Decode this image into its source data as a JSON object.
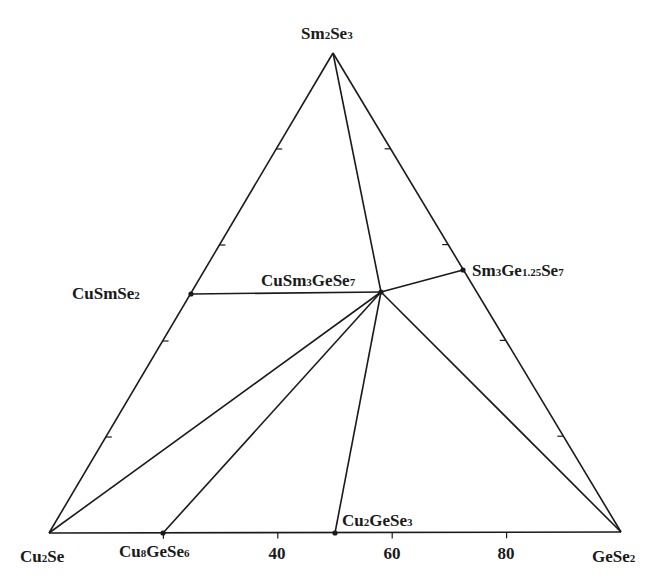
{
  "diagram": {
    "type": "ternary-phase-diagram",
    "line_color": "#1a1a1a",
    "vertices": {
      "top": {
        "label_parts": [
          [
            "Sm",
            ""
          ],
          [
            "2",
            "sub"
          ],
          [
            "Se",
            ""
          ],
          [
            "3",
            "sub"
          ]
        ],
        "x": 333,
        "y": 53
      },
      "bottom_left": {
        "label_parts": [
          [
            "Cu",
            ""
          ],
          [
            "2",
            "sub"
          ],
          [
            "Se",
            ""
          ]
        ],
        "x": 49,
        "y": 533
      },
      "bottom_right": {
        "label_parts": [
          [
            "GeSe",
            ""
          ],
          [
            "2",
            "sub"
          ]
        ],
        "x": 621,
        "y": 532
      }
    },
    "bottom_axis_ticks": [
      {
        "value": "40",
        "x": 277
      },
      {
        "value": "60",
        "x": 392
      },
      {
        "value": "80",
        "x": 506
      }
    ],
    "compounds": [
      {
        "id": "CuSmSe2",
        "label_parts": [
          [
            "CuSmSe",
            ""
          ],
          [
            "2",
            "sub"
          ]
        ],
        "x": 191,
        "y": 294,
        "label_x": 72,
        "label_y": 285
      },
      {
        "id": "CuSm3GeSe7",
        "label_parts": [
          [
            "CuSm",
            ""
          ],
          [
            "3",
            "sub"
          ],
          [
            "GeSe",
            ""
          ],
          [
            "7",
            "sub"
          ]
        ],
        "x": 381,
        "y": 292,
        "label_x": 261,
        "label_y": 272
      },
      {
        "id": "Sm3Ge1.25Se7",
        "label_parts": [
          [
            "Sm",
            ""
          ],
          [
            "3",
            "sub"
          ],
          [
            "Ge",
            ""
          ],
          [
            "1.25",
            "sub"
          ],
          [
            "Se",
            ""
          ],
          [
            "7",
            "sub"
          ]
        ],
        "x": 463,
        "y": 270,
        "label_x": 472,
        "label_y": 262
      },
      {
        "id": "Cu8GeSe6",
        "label_parts": [
          [
            "Cu",
            ""
          ],
          [
            "8",
            "sub"
          ],
          [
            "GeSe",
            ""
          ],
          [
            "6",
            "sub"
          ]
        ],
        "x": 163,
        "y": 533,
        "label_x": 119,
        "label_y": 543
      },
      {
        "id": "Cu2GeSe3",
        "label_parts": [
          [
            "Cu",
            ""
          ],
          [
            "2",
            "sub"
          ],
          [
            "GeSe",
            ""
          ],
          [
            "3",
            "sub"
          ]
        ],
        "x": 335,
        "y": 533,
        "label_x": 342,
        "label_y": 512
      }
    ],
    "tie_lines": [
      [
        "top",
        "CuSm3GeSe7"
      ],
      [
        "CuSmSe2",
        "CuSm3GeSe7"
      ],
      [
        "Sm3Ge1.25Se7",
        "CuSm3GeSe7"
      ],
      [
        "bottom_left",
        "CuSm3GeSe7"
      ],
      [
        "Cu8GeSe6",
        "CuSm3GeSe7"
      ],
      [
        "Cu2GeSe3",
        "CuSm3GeSe7"
      ],
      [
        "bottom_right",
        "CuSm3GeSe7"
      ]
    ],
    "edge_ticks_fraction": [
      0.2,
      0.4,
      0.6,
      0.8
    ]
  }
}
